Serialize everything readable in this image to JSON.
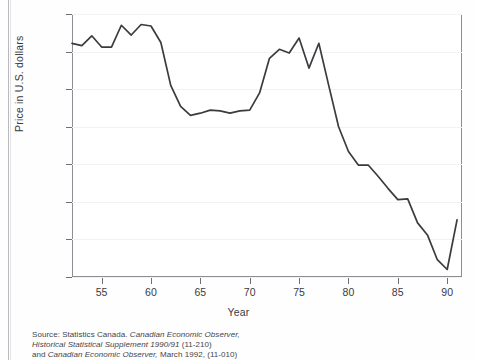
{
  "chart_data": {
    "type": "line",
    "title": "",
    "xlabel": "Year",
    "ylabel": "Price in U.S. dollars",
    "xlim": [
      52,
      91.5
    ],
    "ylim": [
      0.7,
      1.05
    ],
    "grid": true,
    "legend": null,
    "y_tick_labels": [
      "$1.05",
      "1.00",
      ".95",
      ".90",
      ".85",
      ".80",
      ".75",
      ".70"
    ],
    "y_tick_values": [
      1.05,
      1.0,
      0.95,
      0.9,
      0.85,
      0.8,
      0.75,
      0.7
    ],
    "x_tick_labels": [
      "55",
      "60",
      "65",
      "70",
      "75",
      "80",
      "85",
      "90"
    ],
    "x_tick_values": [
      55,
      60,
      65,
      70,
      75,
      80,
      85,
      90
    ],
    "series": [
      {
        "name": "Canadian dollar price in U.S. dollars",
        "color": "#3b3b40",
        "x": [
          52,
          53,
          54,
          55,
          56,
          57,
          58,
          59,
          60,
          61,
          62,
          63,
          64,
          65,
          66,
          67,
          68,
          69,
          70,
          71,
          72,
          73,
          74,
          75,
          76,
          77,
          78,
          79,
          80,
          81,
          82,
          83,
          84,
          85,
          86,
          87,
          88,
          89,
          90,
          91
        ],
        "y": [
          1.011,
          1.008,
          1.021,
          1.006,
          1.006,
          1.035,
          1.022,
          1.036,
          1.034,
          1.012,
          0.955,
          0.927,
          0.915,
          0.918,
          0.922,
          0.921,
          0.918,
          0.921,
          0.922,
          0.945,
          0.991,
          1.003,
          0.998,
          1.018,
          0.978,
          1.011,
          0.955,
          0.9,
          0.867,
          0.849,
          0.849,
          0.834,
          0.818,
          0.803,
          0.804,
          0.772,
          0.756,
          0.723,
          0.71,
          0.776
        ]
      }
    ]
  },
  "axis": {
    "y_title": "Price in U.S. dollars",
    "x_title": "Year",
    "y_labels": [
      "$1.05",
      "1.00",
      ".95",
      ".90",
      ".85",
      ".80",
      ".75",
      ".70"
    ],
    "x_labels": [
      "55",
      "60",
      "65",
      "70",
      "75",
      "80",
      "85",
      "90"
    ]
  },
  "source": {
    "line1_prefix": "Source: Statistics Canada.",
    "line1_italic": "Canadian Economic Observer,",
    "line2_italic": "Historical Statistical Supplement 1990/91",
    "line2_suffix": "(11-210)",
    "line3_prefix": "and",
    "line3_italic": "Canadian Economic Observer,",
    "line3_suffix": "March 1992, (11-010)"
  }
}
